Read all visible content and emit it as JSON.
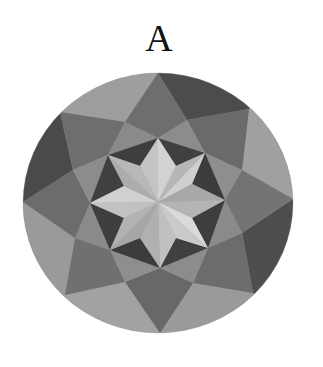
{
  "figure": {
    "label": "A"
  },
  "geometry": {
    "circle": {
      "cx": 158,
      "cy": 203,
      "rx": 135,
      "ry": 130
    },
    "center": [
      158,
      202
    ]
  },
  "colors": {
    "background": "#ffffff",
    "rim_light": "#9c9c9c",
    "rim_dark": "#4c4c4c",
    "kite_medium": "#6e6e6e",
    "kite_medium_alt": "#787878",
    "ring_mid": "#8c8c8c",
    "triangle_dark": "#3e3e3e",
    "star_light": "#d2d2d2",
    "star_light_alt": "#c4c4c4",
    "star_mid": "#b2b2b2",
    "star_mid_alt": "#a6a6a6"
  },
  "colors_used_order": [
    "rim_light",
    "rim_dark",
    "kite_medium",
    "ring_mid",
    "triangle_dark",
    "star_light",
    "star_mid"
  ]
}
